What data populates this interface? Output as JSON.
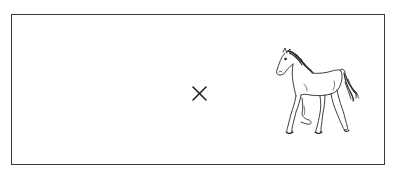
{
  "figure": {
    "frame": {
      "border_color": "#3a3a3a",
      "background": "#ffffff"
    },
    "marker": {
      "symbol": "×",
      "icon": "cross-mark",
      "color": "#222222"
    },
    "illustration": {
      "subject": "horse",
      "style": "black line drawing",
      "pose": "walking, facing left",
      "stroke_color": "#2a2a2a"
    }
  }
}
